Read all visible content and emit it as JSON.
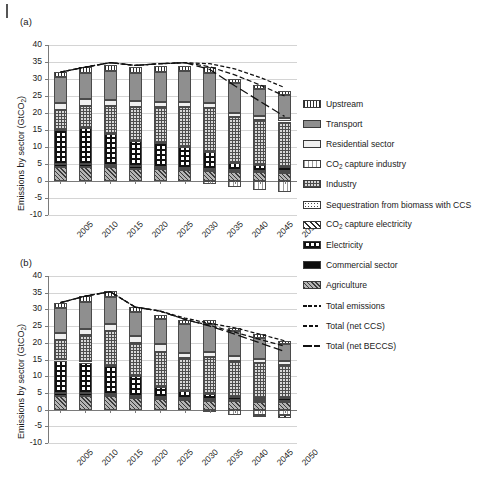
{
  "figure": {
    "panels": [
      {
        "label": "(a)"
      },
      {
        "label": "(b)"
      }
    ],
    "y_axis_title_pre": "Emissions by sector (GtCO",
    "y_axis_title_sub": "2",
    "y_axis_title_post": ")"
  },
  "legend": {
    "items": [
      {
        "key": "upstream",
        "label": "Upstream",
        "pattern": "vertical-lines",
        "color": "#f2f2f2"
      },
      {
        "key": "transport",
        "label": "Transport",
        "pattern": "solid-gray",
        "color": "#8f8f8f"
      },
      {
        "key": "residential",
        "label": "Residential sector",
        "pattern": "fine-dots",
        "color": "#f0f0f0"
      },
      {
        "key": "co2_capture_industry",
        "label_pre": "CO",
        "label_sub": "2",
        "label_post": " capture industry",
        "pattern": "wavy-light",
        "color": "#ffffff"
      },
      {
        "key": "industry",
        "label": "Industry",
        "pattern": "cross-hatch-fine",
        "color": "#d8d8d8"
      },
      {
        "key": "sequestration_beccs",
        "label": "Sequestration from biomass with CCS",
        "pattern": "coarse-dots",
        "color": "#ffffff"
      },
      {
        "key": "co2_capture_electricity",
        "label_pre": "CO",
        "label_sub": "2",
        "label_post": " capture electricity",
        "pattern": "diagonal-hatch",
        "color": "#ffffff"
      },
      {
        "key": "electricity",
        "label": "Electricity",
        "pattern": "checkerboard",
        "color": "#ffffff"
      },
      {
        "key": "commercial",
        "label": "Commercial sector",
        "pattern": "solid-black",
        "color": "#0d0d0d"
      },
      {
        "key": "agriculture",
        "label": "Agriculture",
        "pattern": "dense-diagonal",
        "color": "#b4b4b4"
      }
    ],
    "lines": [
      {
        "key": "total_emissions",
        "label": "Total emissions",
        "style": "dashed-fine"
      },
      {
        "key": "total_net_ccs",
        "label": "Total (net CCS)",
        "style": "dashed-medium"
      },
      {
        "key": "total_net_beccs",
        "label": "Total (net BECCS)",
        "style": "dash-dot-long"
      }
    ]
  },
  "chart_data": [
    {
      "type": "bar",
      "panel": "(a)",
      "title": "",
      "xlabel": "",
      "ylabel": "Emissions by sector (GtCO2)",
      "ylim": [
        -10,
        40
      ],
      "yticks": [
        -10,
        -5,
        0,
        5,
        10,
        15,
        20,
        25,
        30,
        35,
        40
      ],
      "grid": true,
      "stacked": true,
      "legend_position": "right",
      "categories": [
        "2005",
        "2010",
        "2015",
        "2020",
        "2025",
        "2030",
        "2035",
        "2040",
        "2045",
        "2050"
      ],
      "series": [
        {
          "name": "Agriculture",
          "values": [
            4.1,
            4.2,
            4.0,
            3.6,
            3.4,
            3.1,
            2.9,
            2.7,
            2.6,
            2.5
          ]
        },
        {
          "name": "Commercial sector",
          "values": [
            0.8,
            0.8,
            0.8,
            0.7,
            0.6,
            0.6,
            0.5,
            0.5,
            0.4,
            0.4
          ]
        },
        {
          "name": "Electricity",
          "values": [
            10.0,
            10.6,
            9.0,
            7.6,
            7.1,
            6.2,
            5.0,
            2.0,
            1.6,
            1.3
          ]
        },
        {
          "name": "Industry",
          "values": [
            6.1,
            6.5,
            8.2,
            9.9,
            10.6,
            11.8,
            13.1,
            13.5,
            13.4,
            13.3
          ]
        },
        {
          "name": "Residential sector",
          "values": [
            2.0,
            1.9,
            1.8,
            1.7,
            1.6,
            1.5,
            1.4,
            1.3,
            1.2,
            1.1
          ]
        },
        {
          "name": "Transport",
          "values": [
            7.5,
            7.9,
            8.5,
            8.4,
            8.8,
            9.2,
            9.0,
            8.7,
            7.8,
            6.8
          ]
        },
        {
          "name": "Upstream",
          "values": [
            1.5,
            1.6,
            1.7,
            1.6,
            1.6,
            1.5,
            1.5,
            1.4,
            1.3,
            1.2
          ]
        },
        {
          "name": "CO2 capture industry",
          "values": [
            0,
            0,
            0,
            0,
            0,
            0,
            -0.9,
            -1.8,
            -2.6,
            -3.3
          ]
        },
        {
          "name": "CO2 capture electricity",
          "values": [
            0,
            0,
            0,
            0,
            0,
            0,
            0,
            0,
            0,
            0
          ]
        },
        {
          "name": "Sequestration from biomass with CCS",
          "values": [
            0,
            0,
            0,
            0,
            0,
            0,
            0,
            0,
            0,
            0
          ]
        }
      ],
      "lines": [
        {
          "name": "Total emissions",
          "values": [
            32.0,
            33.5,
            34.8,
            34.0,
            34.5,
            34.8,
            34.5,
            33.0,
            30.5,
            27.5
          ]
        },
        {
          "name": "Total (net CCS)",
          "values": [
            32.0,
            33.5,
            34.8,
            34.0,
            34.5,
            34.8,
            33.6,
            31.2,
            28.3,
            25.0
          ]
        },
        {
          "name": "Total (net BECCS)",
          "values": [
            32.0,
            33.5,
            34.8,
            34.0,
            34.5,
            34.8,
            32.8,
            28.0,
            23.5,
            19.0
          ]
        }
      ]
    },
    {
      "type": "bar",
      "panel": "(b)",
      "title": "",
      "xlabel": "",
      "ylabel": "Emissions by sector (GtCO2)",
      "ylim": [
        -10,
        40
      ],
      "yticks": [
        -10,
        -5,
        0,
        5,
        10,
        15,
        20,
        25,
        30,
        35,
        40
      ],
      "grid": true,
      "stacked": true,
      "legend_position": "right",
      "categories": [
        "2005",
        "2010",
        "2015",
        "2020",
        "2025",
        "2030",
        "2035",
        "2040",
        "2045",
        "2050"
      ],
      "series": [
        {
          "name": "Agriculture",
          "values": [
            4.1,
            4.2,
            4.0,
            3.5,
            3.1,
            2.9,
            2.7,
            2.5,
            2.4,
            2.3
          ]
        },
        {
          "name": "Commercial sector",
          "values": [
            0.8,
            0.8,
            0.8,
            0.7,
            0.6,
            0.5,
            0.5,
            0.4,
            0.4,
            0.4
          ]
        },
        {
          "name": "Electricity",
          "values": [
            9.8,
            9.1,
            8.3,
            6.0,
            3.0,
            2.1,
            1.4,
            0.9,
            0.8,
            0.7
          ]
        },
        {
          "name": "Industry",
          "values": [
            6.2,
            8.2,
            10.5,
            9.6,
            10.6,
            9.8,
            11.2,
            10.8,
            10.3,
            10.0
          ]
        },
        {
          "name": "Residential sector",
          "values": [
            2.0,
            1.9,
            1.9,
            2.2,
            2.3,
            1.5,
            1.4,
            1.3,
            1.2,
            1.1
          ]
        },
        {
          "name": "Transport",
          "values": [
            7.5,
            8.1,
            8.2,
            7.2,
            7.4,
            8.8,
            8.5,
            7.5,
            6.4,
            5.2
          ]
        },
        {
          "name": "Upstream",
          "values": [
            1.6,
            1.7,
            1.7,
            1.5,
            1.4,
            1.3,
            1.2,
            1.1,
            1.0,
            0.9
          ]
        },
        {
          "name": "CO2 capture industry",
          "values": [
            0,
            0,
            0,
            0,
            0,
            0,
            -0.5,
            -1.6,
            -1.6,
            -1.6
          ]
        },
        {
          "name": "CO2 capture electricity",
          "values": [
            0,
            0,
            0,
            0,
            0,
            0,
            0,
            0,
            -0.6,
            -1.0
          ]
        },
        {
          "name": "Sequestration from biomass with CCS",
          "values": [
            0,
            0,
            0,
            0,
            0,
            0,
            0,
            0,
            0,
            0
          ]
        }
      ],
      "lines": [
        {
          "name": "Total emissions",
          "values": [
            32.0,
            34.0,
            35.3,
            30.7,
            29.5,
            27.4,
            25.8,
            24.5,
            22.6,
            20.6
          ]
        },
        {
          "name": "Total (net CCS)",
          "values": [
            32.0,
            34.0,
            35.3,
            30.7,
            29.5,
            27.0,
            25.2,
            23.2,
            21.0,
            19.0
          ]
        },
        {
          "name": "Total (net BECCS)",
          "values": [
            32.0,
            34.0,
            35.3,
            30.7,
            29.5,
            27.0,
            25.0,
            22.6,
            20.0,
            17.4
          ]
        }
      ]
    }
  ]
}
